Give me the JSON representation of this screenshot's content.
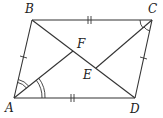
{
  "figure": {
    "type": "parallelogram",
    "points": {
      "A": {
        "label": "A",
        "x": 14,
        "y": 98,
        "lx": 5,
        "ly": 112
      },
      "B": {
        "label": "B",
        "x": 32,
        "y": 20,
        "lx": 25,
        "ly": 13
      },
      "C": {
        "label": "C",
        "x": 152,
        "y": 20,
        "lx": 148,
        "ly": 13
      },
      "D": {
        "label": "D",
        "x": 135,
        "y": 98,
        "lx": 130,
        "ly": 113
      },
      "F": {
        "label": "F",
        "x": 73,
        "y": 51,
        "lx": 77,
        "ly": 48
      },
      "E": {
        "label": "E",
        "x": 96,
        "y": 68,
        "lx": 83,
        "ly": 79
      }
    },
    "segments": [
      "AB",
      "BC",
      "CD",
      "DA",
      "BD",
      "AF",
      "CE"
    ],
    "tick_marks": {
      "single": [
        "AB",
        "CD"
      ],
      "double": [
        "BC",
        "AD"
      ]
    },
    "angle_marks": {
      "A": "double arcs (angle bisector AF)",
      "C": "single arcs (angle bisector CE)"
    },
    "colors": {
      "line": "#333333",
      "text": "#222222",
      "background": "#ffffff"
    }
  }
}
